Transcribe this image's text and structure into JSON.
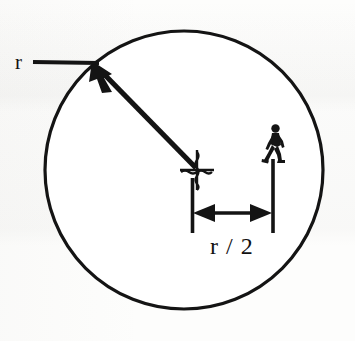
{
  "figure": {
    "stroke_color": "#141414",
    "background_color": "#fdfdfc",
    "labels": {
      "radius": "r",
      "half_radius": "r / 2"
    },
    "icons": {
      "center_mark": "squiggly-cross-center-mark",
      "person": "walking-person-figure",
      "radius_arrow": "arrow-up-left",
      "dimension_arrow": "double-headed-arrow-horizontal"
    },
    "geometry": {
      "circle_center_x": 184,
      "circle_center_y": 170,
      "circle_radius": 139,
      "circle_stroke_width": 3,
      "radius_arrow_from_x": 196,
      "radius_arrow_from_y": 168,
      "radius_arrow_to_x": 95,
      "radius_arrow_to_y": 65,
      "leader_line_x1": 33,
      "leader_line_x2": 98,
      "leader_line_y": 62,
      "center_mark_x": 197,
      "center_mark_y": 170,
      "person_x": 273,
      "person_y": 143,
      "ext_line_left_x": 192,
      "ext_line_left_y1": 178,
      "ext_line_left_y2": 232,
      "ext_line_right_x": 273,
      "ext_line_right_y1": 160,
      "ext_line_right_y2": 232,
      "dim_arrow_y": 213
    }
  }
}
